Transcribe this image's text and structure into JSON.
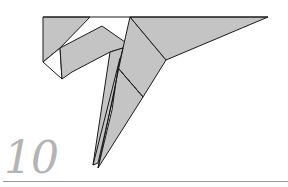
{
  "step": {
    "number": "10"
  },
  "colors": {
    "paper_fill": "#c4c4c4",
    "outline": "#1a1a1a",
    "step_number": "#b4b4b4",
    "rule": "#9a9a9a",
    "background": "#ffffff"
  },
  "diagram": {
    "fold_lines": [
      {
        "type": "valley-dashed",
        "from": [
          118,
          68
        ],
        "to": [
          143,
          97
        ]
      }
    ]
  }
}
